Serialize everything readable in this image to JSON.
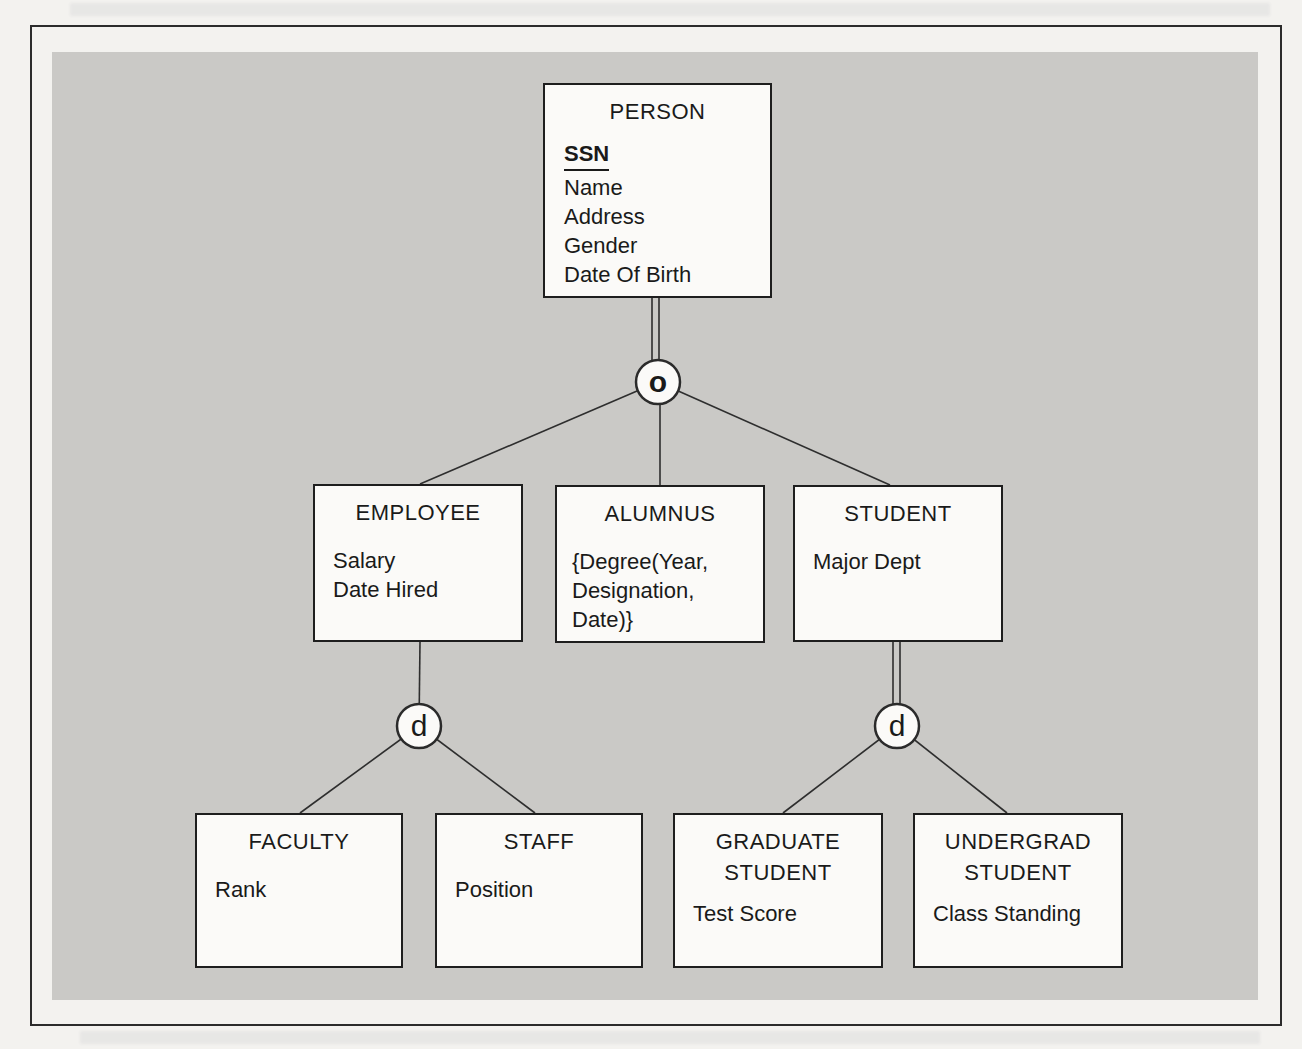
{
  "figure": {
    "kind": "eer-specialization-hierarchy-diagram",
    "entities": {
      "person": {
        "title": "PERSON",
        "key_attribute": "SSN",
        "attributes": [
          "Name",
          "Address",
          "Gender",
          "Date Of Birth"
        ]
      },
      "employee": {
        "title": "EMPLOYEE",
        "attributes": [
          "Salary",
          "Date Hired"
        ]
      },
      "alumnus": {
        "title": "ALUMNUS",
        "attributes": [
          "{Degree(Year,",
          "Designation,",
          "Date)}"
        ]
      },
      "student": {
        "title": "STUDENT",
        "attributes": [
          "Major Dept"
        ]
      },
      "faculty": {
        "title": "FACULTY",
        "attributes": [
          "Rank"
        ]
      },
      "staff": {
        "title": "STAFF",
        "attributes": [
          "Position"
        ]
      },
      "graduate_student": {
        "title_lines": [
          "GRADUATE",
          "STUDENT"
        ],
        "attributes": [
          "Test Score"
        ]
      },
      "undergrad_student": {
        "title_lines": [
          "UNDERGRAD",
          "STUDENT"
        ],
        "attributes": [
          "Class Standing"
        ]
      }
    },
    "circles": {
      "overlapping": "o",
      "disjoint_employee": "d",
      "disjoint_student": "d"
    },
    "colors": {
      "page_bg": "#f3f2ef",
      "panel_bg": "#cac9c6",
      "box_bg": "#fbfaf8",
      "line": "#2e2e2e",
      "text": "#1a1a1a"
    }
  }
}
